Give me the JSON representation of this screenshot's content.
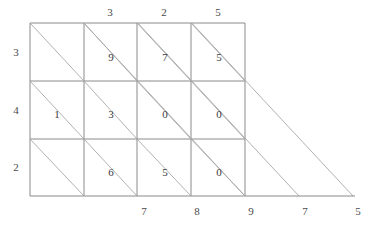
{
  "figure": {
    "kind": "lattice-multiplication-grid",
    "grid": {
      "columns": 4,
      "rows": 3,
      "left": 30,
      "top": 23,
      "right": 245,
      "bottom": 196,
      "col_edges": [
        30,
        84,
        137,
        191,
        245
      ],
      "row_edges": [
        23,
        81,
        139,
        196
      ],
      "line_color": "#8a8a8a",
      "diagonal_color": "#a8a8a8"
    },
    "extension": {
      "baseline_end_x": 355,
      "baseline_y": 196,
      "diagonal_ends_x": [
        245,
        299,
        353
      ]
    }
  },
  "top_labels": [
    {
      "text": "",
      "x": 57
    },
    {
      "text": "3",
      "x": 110
    },
    {
      "text": "2",
      "x": 164
    },
    {
      "text": "5",
      "x": 218
    }
  ],
  "left_labels": [
    {
      "text": "3",
      "y": 52
    },
    {
      "text": "4",
      "y": 110
    },
    {
      "text": "2",
      "y": 167
    }
  ],
  "bottom_labels": [
    {
      "text": "7",
      "x": 144
    },
    {
      "text": "8",
      "x": 197
    },
    {
      "text": "9",
      "x": 251
    },
    {
      "text": "7",
      "x": 305
    },
    {
      "text": "5",
      "x": 358
    }
  ],
  "cells": [
    {
      "row": 0,
      "col": 0,
      "digit": "",
      "x": 57,
      "y": 57
    },
    {
      "row": 0,
      "col": 1,
      "digit": "9",
      "x": 111,
      "y": 57
    },
    {
      "row": 0,
      "col": 2,
      "digit": "7",
      "x": 165,
      "y": 57
    },
    {
      "row": 0,
      "col": 3,
      "digit": "5",
      "x": 219,
      "y": 57
    },
    {
      "row": 1,
      "col": 0,
      "digit": "1",
      "x": 57,
      "y": 114
    },
    {
      "row": 1,
      "col": 1,
      "digit": "3",
      "x": 111,
      "y": 114
    },
    {
      "row": 1,
      "col": 2,
      "digit": "0",
      "x": 165,
      "y": 114
    },
    {
      "row": 1,
      "col": 3,
      "digit": "0",
      "x": 219,
      "y": 114
    },
    {
      "row": 2,
      "col": 0,
      "digit": "",
      "x": 57,
      "y": 172
    },
    {
      "row": 2,
      "col": 1,
      "digit": "6",
      "x": 111,
      "y": 172
    },
    {
      "row": 2,
      "col": 2,
      "digit": "5",
      "x": 165,
      "y": 172
    },
    {
      "row": 2,
      "col": 3,
      "digit": "0",
      "x": 219,
      "y": 172
    }
  ]
}
